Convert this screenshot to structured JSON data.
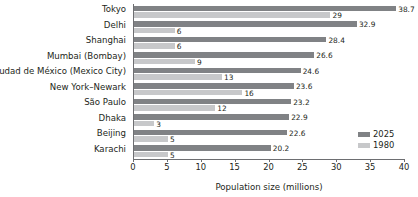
{
  "chart_data": {
    "type": "bar",
    "orientation": "horizontal",
    "title": "",
    "xlabel": "Population size (millions)",
    "ylabel": "",
    "xlim": [
      0,
      40
    ],
    "xticks": [
      0,
      5,
      10,
      15,
      20,
      25,
      30,
      35,
      40
    ],
    "grid": false,
    "legend_position": "right",
    "categories": [
      "Tokyo",
      "Delhi",
      "Shanghai",
      "Mumbai (Bombay)",
      "Ciudad de México (Mexico City)",
      "New York–Newark",
      "São Paulo",
      "Dhaka",
      "Beijing",
      "Karachi"
    ],
    "series": [
      {
        "name": "2025",
        "color": "#808285",
        "values": [
          38.7,
          32.9,
          28.4,
          26.6,
          24.6,
          23.6,
          23.2,
          22.9,
          22.6,
          20.2
        ],
        "labels": [
          "38.7",
          "32.9",
          "28.4",
          "26.6",
          "24.6",
          "23.6",
          "23.2",
          "22.9",
          "22.6",
          "20.2"
        ]
      },
      {
        "name": "1980",
        "color": "#c7c8ca",
        "values": [
          29,
          6,
          6,
          9,
          13,
          16,
          12,
          3,
          5,
          5
        ],
        "labels": [
          "29",
          "6",
          "6",
          "9",
          "13",
          "16",
          "12",
          "3",
          "5",
          "5"
        ]
      }
    ]
  },
  "legend": {
    "items": [
      {
        "label": "2025",
        "color": "#808285"
      },
      {
        "label": "1980",
        "color": "#c7c8ca"
      }
    ]
  },
  "axis": {
    "x_title": "Population size (millions)",
    "tick_labels": [
      "0",
      "5",
      "10",
      "15",
      "20",
      "25",
      "30",
      "35",
      "40"
    ]
  },
  "colors": {
    "series_2025": "#808285",
    "series_1980": "#c7c8ca",
    "axis": "#6d6e71",
    "text": "#231f20",
    "background": "#ffffff"
  }
}
